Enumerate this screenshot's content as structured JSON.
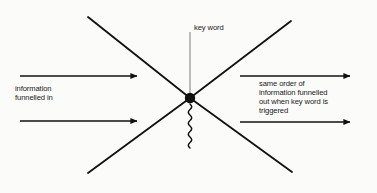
{
  "diagram": {
    "background_color": "#fbfbfa",
    "stroke_color": "#111111",
    "labels": {
      "key_word": "key word",
      "input": "information\nfunnelled in",
      "output": "same order of\ninformation funnelled\nout when key word is\ntriggered"
    },
    "node": {
      "name": "key-word-node",
      "shape": "filled-circle",
      "color": "#111111",
      "cx": 190,
      "cy": 98,
      "r": 5
    },
    "crossing_lines": [
      {
        "name": "diagonal-upper-left",
        "x1": 88,
        "y1": 17,
        "x2": 190,
        "y2": 98
      },
      {
        "name": "diagonal-upper-right",
        "x1": 291,
        "y1": 21,
        "x2": 190,
        "y2": 98
      },
      {
        "name": "diagonal-lower-left",
        "x1": 88,
        "y1": 173,
        "x2": 190,
        "y2": 98
      },
      {
        "name": "diagonal-lower-right",
        "x1": 292,
        "y1": 172,
        "x2": 190,
        "y2": 98
      }
    ],
    "key_word_line": {
      "name": "key-word-connector",
      "x1": 190,
      "y1": 32,
      "x2": 190,
      "y2": 96
    },
    "squiggle": {
      "name": "trigger-squiggle",
      "x": 190,
      "y_start": 104,
      "y_end": 148,
      "oscillations": 8,
      "amplitude": 3
    },
    "arrows": [
      {
        "name": "input-arrow-top",
        "x1": 20,
        "y1": 76,
        "x2": 143,
        "y2": 76,
        "direction": "right"
      },
      {
        "name": "input-arrow-bottom",
        "x1": 20,
        "y1": 121,
        "x2": 143,
        "y2": 121,
        "direction": "right"
      },
      {
        "name": "output-arrow-top",
        "x1": 240,
        "y1": 76,
        "x2": 356,
        "y2": 76,
        "direction": "right"
      },
      {
        "name": "output-arrow-bottom",
        "x1": 240,
        "y1": 122,
        "x2": 356,
        "y2": 122,
        "direction": "right"
      }
    ]
  }
}
